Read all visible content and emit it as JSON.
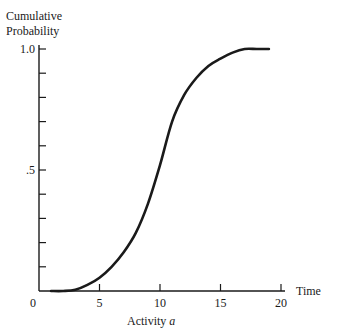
{
  "chart_data": {
    "type": "line",
    "title": "",
    "ylabel_lines": [
      "Cumulative",
      "Probability"
    ],
    "xlabel_right": "Time",
    "xlabel_below": "Activity",
    "xlabel_below_italic": "a",
    "xlim": [
      0,
      20
    ],
    "ylim": [
      0,
      1.0
    ],
    "x_ticks": [
      0,
      5,
      10,
      15,
      20
    ],
    "x_tick_labels": [
      "0",
      "5",
      "10",
      "15",
      "20"
    ],
    "y_ticks": [
      0,
      0.1,
      0.2,
      0.3,
      0.4,
      0.5,
      0.6,
      0.7,
      0.8,
      0.9,
      1.0
    ],
    "y_tick_labels": [
      {
        "value": 0.5,
        "label": ".5"
      },
      {
        "value": 1.0,
        "label": "1.0"
      }
    ],
    "grid": false,
    "series": [
      {
        "name": "Cumulative probability of Activity a",
        "color": "#1a1a1a",
        "x": [
          1,
          2,
          3,
          4,
          5,
          6,
          7,
          8,
          9,
          10,
          11,
          12,
          13,
          14,
          15,
          16,
          17,
          18,
          19
        ],
        "y": [
          0,
          0,
          0.005,
          0.025,
          0.055,
          0.1,
          0.16,
          0.24,
          0.36,
          0.52,
          0.7,
          0.81,
          0.88,
          0.93,
          0.96,
          0.985,
          1.0,
          1.0,
          1.0
        ]
      }
    ]
  }
}
